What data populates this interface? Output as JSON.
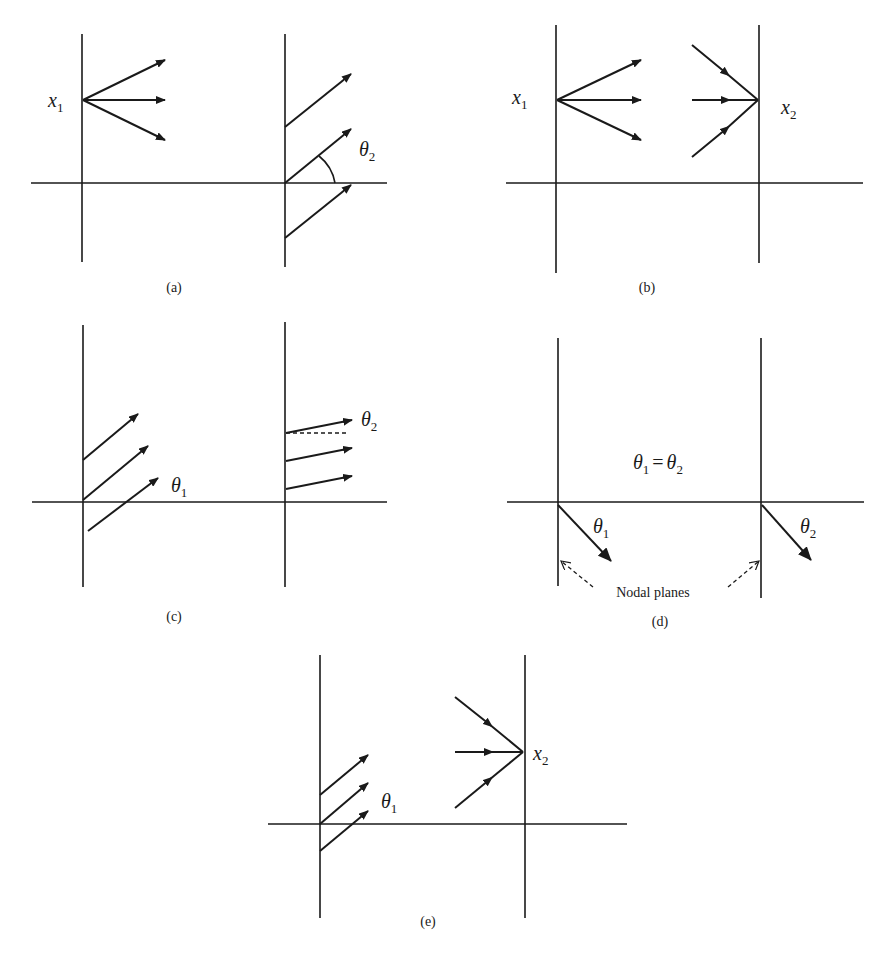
{
  "figure": {
    "panels": [
      {
        "id": "a",
        "caption": "(a)",
        "labels": {
          "left_point": "x",
          "left_point_sub": "1",
          "angle": "θ",
          "angle_sub": "2"
        }
      },
      {
        "id": "b",
        "caption": "(b)",
        "labels": {
          "left_point": "x",
          "left_point_sub": "1",
          "right_point": "x",
          "right_point_sub": "2"
        }
      },
      {
        "id": "c",
        "caption": "(c)",
        "labels": {
          "left_angle": "θ",
          "left_angle_sub": "1",
          "right_angle": "θ",
          "right_angle_sub": "2"
        }
      },
      {
        "id": "d",
        "caption": "(d)",
        "labels": {
          "equation_lhs": "θ",
          "equation_lhs_sub": "1",
          "equation_op": "=",
          "equation_rhs": "θ",
          "equation_rhs_sub": "2",
          "left_angle": "θ",
          "left_angle_sub": "1",
          "right_angle": "θ",
          "right_angle_sub": "2",
          "note": "Nodal planes"
        }
      },
      {
        "id": "e",
        "caption": "(e)",
        "labels": {
          "left_angle": "θ",
          "left_angle_sub": "1",
          "right_point": "x",
          "right_point_sub": "2"
        }
      }
    ]
  }
}
